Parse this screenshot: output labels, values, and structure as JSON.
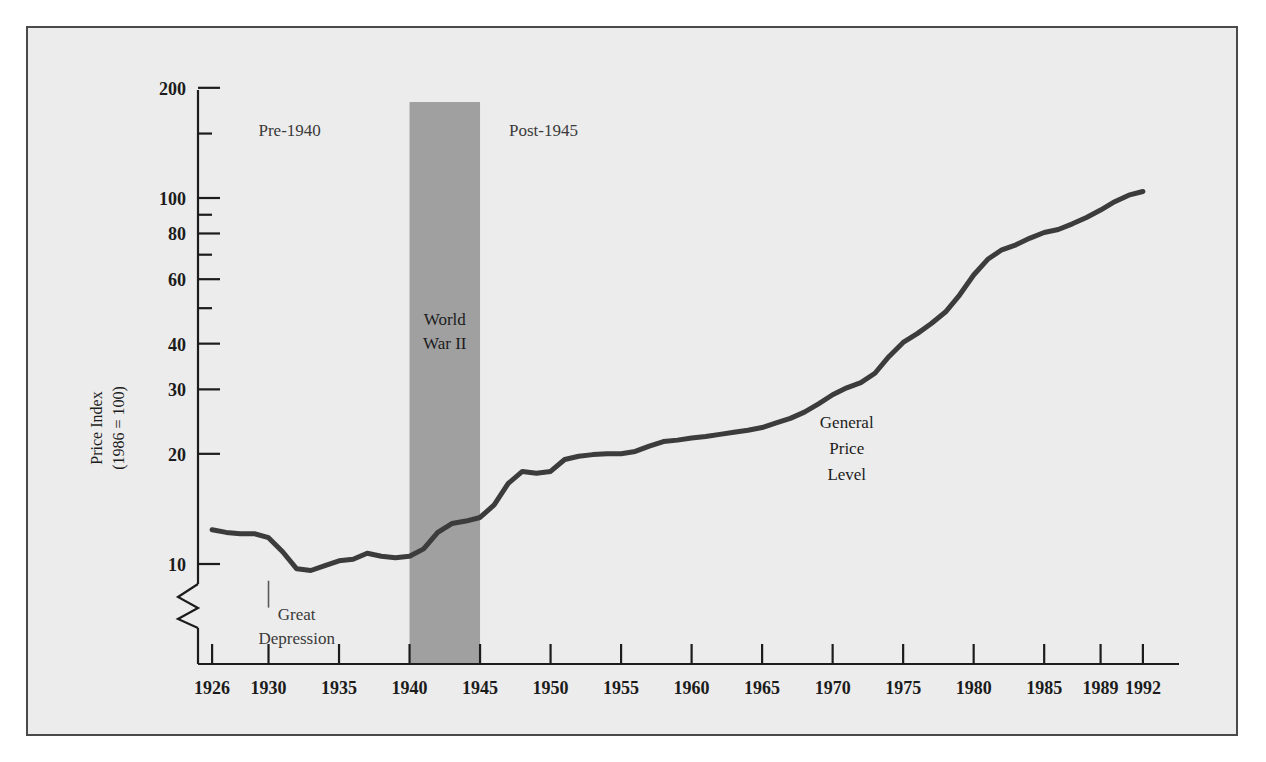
{
  "figure": {
    "background_color": "#ececec",
    "frame_color": "#4a4a4a",
    "page_color": "#ffffff"
  },
  "chart_data": {
    "type": "line",
    "title": "",
    "xlabel": "",
    "ylabel": "Price Index\n(1986 = 100)",
    "ylabel_line1": "Price Index",
    "ylabel_line2": "(1986 = 100)",
    "yscale": "log",
    "ylim": [
      8.2,
      230
    ],
    "xlim": [
      1925,
      1993
    ],
    "grid": false,
    "legend": "none",
    "yticks": [
      10,
      20,
      30,
      40,
      60,
      80,
      100,
      200
    ],
    "ytick_labels": [
      "10",
      "20",
      "30",
      "40",
      "60",
      "80",
      "100",
      "200"
    ],
    "yticks_minor": [
      50,
      70,
      90,
      150
    ],
    "xticks": [
      1926,
      1930,
      1935,
      1940,
      1945,
      1950,
      1955,
      1960,
      1965,
      1970,
      1975,
      1980,
      1985,
      1989,
      1992
    ],
    "xtick_labels": [
      "1926",
      "1930",
      "1935",
      "1940",
      "1945",
      "1950",
      "1955",
      "1960",
      "1965",
      "1970",
      "1975",
      "1980",
      "1985",
      "1989",
      "1992"
    ],
    "axis_break": true,
    "series": [
      {
        "name": "General Price Level",
        "color": "#3c3c3c",
        "x": [
          1926,
          1927,
          1928,
          1929,
          1930,
          1931,
          1932,
          1933,
          1934,
          1935,
          1936,
          1937,
          1938,
          1939,
          1940,
          1941,
          1942,
          1943,
          1944,
          1945,
          1946,
          1947,
          1948,
          1949,
          1950,
          1951,
          1952,
          1953,
          1954,
          1955,
          1956,
          1957,
          1958,
          1959,
          1960,
          1961,
          1962,
          1963,
          1964,
          1965,
          1966,
          1967,
          1968,
          1969,
          1970,
          1971,
          1972,
          1973,
          1974,
          1975,
          1976,
          1977,
          1978,
          1979,
          1980,
          1981,
          1982,
          1983,
          1984,
          1985,
          1986,
          1987,
          1988,
          1989,
          1990,
          1991,
          1992
        ],
        "y": [
          12.4,
          12.2,
          12.1,
          12.1,
          11.8,
          10.8,
          9.7,
          9.6,
          9.9,
          10.2,
          10.3,
          10.7,
          10.5,
          10.4,
          10.5,
          11.0,
          12.2,
          12.9,
          13.1,
          13.4,
          14.5,
          16.6,
          17.9,
          17.7,
          17.9,
          19.3,
          19.7,
          19.9,
          20.0,
          20.0,
          20.3,
          21.0,
          21.6,
          21.8,
          22.1,
          22.3,
          22.6,
          22.9,
          23.2,
          23.6,
          24.3,
          25.0,
          26.0,
          27.4,
          29.0,
          30.3,
          31.3,
          33.2,
          36.9,
          40.3,
          42.6,
          45.4,
          48.8,
          54.3,
          61.6,
          68.0,
          72.2,
          74.5,
          77.7,
          80.5,
          82.0,
          85.0,
          88.5,
          92.7,
          97.7,
          101.8,
          104.2
        ]
      }
    ],
    "shaded_regions": [
      {
        "label": "World War II",
        "x_start": 1940,
        "x_end": 1945,
        "color": "#a0a0a0"
      }
    ],
    "annotations": [
      {
        "text": "Pre-1940",
        "x": 1931.5,
        "y": 148,
        "style": "gray"
      },
      {
        "text": "Post-1945",
        "x": 1949.5,
        "y": 148,
        "style": "gray"
      },
      {
        "text": "World War II",
        "line1": "World",
        "line2": "War II",
        "x": 1942.5,
        "y": 45,
        "style": "dark-on-band"
      },
      {
        "text": "Great Depression",
        "line1": "Great",
        "line2": "Depression",
        "x": 1932.0,
        "y": 7.1,
        "style": "gray-leader"
      },
      {
        "text": "General Price Level",
        "line1": "General",
        "line2": "Price",
        "line3": "Level",
        "x": 1971.0,
        "y": 23.5,
        "style": "dark"
      }
    ]
  }
}
